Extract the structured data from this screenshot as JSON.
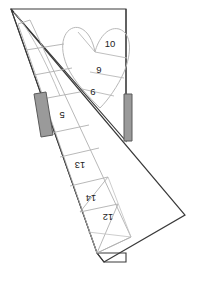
{
  "figure": {
    "background_color": "#ffffff",
    "outer_outline_color": "#3a3a3a",
    "inner_outline_color": "#b0b0b0",
    "mid_outline_color": "#8c8c8c",
    "bar_fill_color": "#9a9a9a",
    "bar_stroke_color": "#5a5a5a",
    "label_color": "#1c1c1c"
  },
  "labels": {
    "upright": [
      {
        "id": "label-10",
        "text": "10",
        "x": 110,
        "y": 47,
        "rotation": 0
      },
      {
        "id": "label-9",
        "text": "9",
        "x": 99,
        "y": 73,
        "rotation": 0
      },
      {
        "id": "label-6",
        "text": "6",
        "x": 93,
        "y": 95,
        "rotation": 0
      }
    ],
    "rotated": [
      {
        "id": "label-5",
        "text": "5",
        "x": 62,
        "y": 118,
        "rotation": 180
      },
      {
        "id": "label-13",
        "text": "13",
        "x": 80,
        "y": 168,
        "rotation": 180
      },
      {
        "id": "label-14",
        "text": "14",
        "x": 91,
        "y": 201,
        "rotation": 180
      },
      {
        "id": "label-12",
        "text": "12",
        "x": 108,
        "y": 220,
        "rotation": 180
      }
    ]
  },
  "bars": {
    "left_bar": {
      "id": "left-gray-bar",
      "fill": "#9a9a9a"
    },
    "right_bar": {
      "id": "right-gray-bar",
      "fill": "#9a9a9a"
    }
  }
}
